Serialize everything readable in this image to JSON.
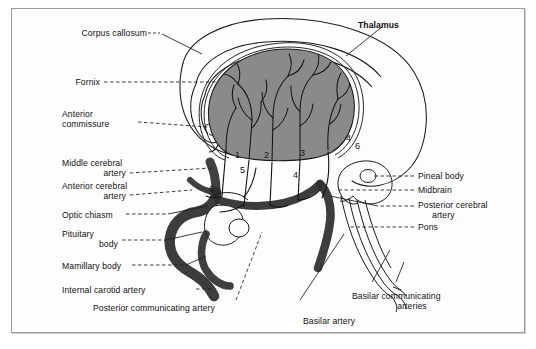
{
  "figure": {
    "title_label": "Thalamus",
    "border_color": "#9b9b9b",
    "thalamus_fill": "#8a8a8a",
    "ink_color": "#111111",
    "background": "#fdfdfd"
  },
  "labels_left": [
    {
      "id": "corpus-callosum",
      "text": "Corpus callosum"
    },
    {
      "id": "fornix",
      "text": "Fornix"
    },
    {
      "id": "anterior-commissure-l1",
      "text": "Anterior"
    },
    {
      "id": "anterior-commissure-l2",
      "text": "commissure"
    },
    {
      "id": "middle-cerebral-artery-l1",
      "text": "Middle cerebral"
    },
    {
      "id": "middle-cerebral-artery-l2",
      "text": "artery"
    },
    {
      "id": "anterior-cerebral-artery-l1",
      "text": "Anterior cerebral"
    },
    {
      "id": "anterior-cerebral-artery-l2",
      "text": "artery"
    },
    {
      "id": "optic-chiasm",
      "text": "Optic chiasm"
    },
    {
      "id": "pituitary-body-l1",
      "text": "Pituitary"
    },
    {
      "id": "pituitary-body-l2",
      "text": "body"
    },
    {
      "id": "mamillary-body",
      "text": "Mamillary body"
    },
    {
      "id": "internal-carotid-artery",
      "text": "Internal carotid artery"
    }
  ],
  "labels_right": [
    {
      "id": "pineal-body",
      "text": "Pineal body"
    },
    {
      "id": "midbrain",
      "text": "Midbrain"
    },
    {
      "id": "posterior-cerebral-artery-l1",
      "text": "Posterior cerebral"
    },
    {
      "id": "posterior-cerebral-artery-l2",
      "text": "artery"
    },
    {
      "id": "pons",
      "text": "Pons"
    }
  ],
  "labels_bottom": [
    {
      "id": "posterior-communicating-artery",
      "text": "Posterior communicating artery"
    },
    {
      "id": "basilar-communicating-arteries-l1",
      "text": "Basilar communicating"
    },
    {
      "id": "basilar-communicating-arteries-l2",
      "text": "arteries"
    },
    {
      "id": "basilar-artery",
      "text": "Basilar artery"
    }
  ],
  "callout_numbers": [
    {
      "id": "callout-1",
      "text": "1"
    },
    {
      "id": "callout-2",
      "text": "2"
    },
    {
      "id": "callout-3",
      "text": "3"
    },
    {
      "id": "callout-4a",
      "text": "4"
    },
    {
      "id": "callout-4b",
      "text": "4"
    },
    {
      "id": "callout-5",
      "text": "5"
    },
    {
      "id": "callout-6a",
      "text": "6"
    },
    {
      "id": "callout-6b",
      "text": "6"
    }
  ]
}
